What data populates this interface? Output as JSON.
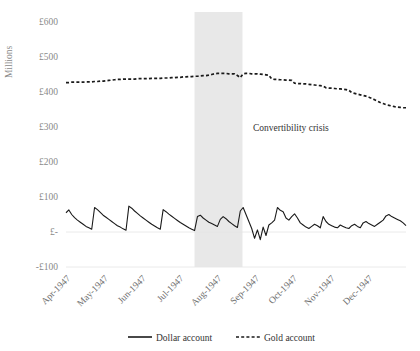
{
  "chart_data": {
    "type": "line",
    "title": "",
    "xlabel": "",
    "ylabel": "Millions",
    "ylim": [
      -100,
      600
    ],
    "ytick_labels": [
      "£600",
      "£500",
      "£400",
      "£300",
      "£200",
      "£100",
      "£-",
      "-£100"
    ],
    "ytick_values": [
      600,
      500,
      400,
      300,
      200,
      100,
      0,
      -100
    ],
    "xtick_labels": [
      "Apr-1947",
      "May-1947",
      "Jun-1947",
      "Jul-1947",
      "Aug-1947",
      "Sep-1947",
      "Oct-1947",
      "Nov-1947",
      "Dec-1947"
    ],
    "grid": "horizontal-faint",
    "legend_position": "bottom",
    "annotations": [
      {
        "text": "Convertibility crisis",
        "x_fraction": 0.55,
        "y_value": 290
      }
    ],
    "shaded_bands": [
      {
        "label": "Convertibility crisis",
        "x_start_fraction": 0.378,
        "x_end_fraction": 0.519,
        "color": "#e8e8e8"
      }
    ],
    "series": [
      {
        "name": "Dollar account",
        "style": "solid",
        "color": "#1a1a1a",
        "values": [
          55,
          63,
          50,
          41,
          34,
          28,
          22,
          16,
          12,
          8,
          70,
          64,
          56,
          48,
          42,
          36,
          30,
          24,
          18,
          14,
          9,
          5,
          74,
          68,
          60,
          53,
          46,
          40,
          34,
          28,
          22,
          17,
          12,
          8,
          64,
          58,
          51,
          45,
          39,
          33,
          27,
          22,
          17,
          12,
          8,
          4,
          44,
          48,
          40,
          34,
          28,
          24,
          20,
          16,
          36,
          44,
          38,
          30,
          24,
          18,
          13,
          60,
          70,
          50,
          30,
          10,
          -18,
          6,
          -22,
          14,
          -10,
          20,
          26,
          34,
          70,
          62,
          58,
          40,
          34,
          44,
          52,
          40,
          26,
          20,
          14,
          10,
          16,
          22,
          18,
          12,
          44,
          30,
          22,
          18,
          14,
          12,
          20,
          16,
          12,
          10,
          18,
          22,
          16,
          12,
          26,
          30,
          24,
          20,
          16,
          22,
          28,
          34,
          46,
          50,
          44,
          40,
          36,
          32,
          26,
          18
        ]
      },
      {
        "name": "Gold account",
        "style": "dashed",
        "color": "#1a1a1a",
        "values": [
          427,
          427,
          428,
          428,
          428,
          428,
          428,
          429,
          429,
          429,
          430,
          430,
          431,
          431,
          432,
          433,
          434,
          435,
          436,
          436,
          437,
          437,
          437,
          437,
          437,
          438,
          438,
          438,
          438,
          438,
          439,
          439,
          439,
          439,
          440,
          440,
          440,
          441,
          441,
          442,
          442,
          443,
          443,
          444,
          444,
          445,
          445,
          446,
          447,
          447,
          448,
          450,
          452,
          453,
          453,
          453,
          453,
          452,
          452,
          452,
          447,
          441,
          452,
          453,
          453,
          452,
          452,
          452,
          451,
          450,
          449,
          448,
          437,
          436,
          436,
          435,
          435,
          434,
          434,
          433,
          425,
          424,
          424,
          423,
          423,
          422,
          421,
          420,
          419,
          418,
          417,
          412,
          411,
          411,
          410,
          409,
          409,
          408,
          407,
          405,
          398,
          396,
          394,
          392,
          390,
          388,
          385,
          382,
          378,
          374,
          370,
          367,
          364,
          362,
          360,
          358,
          357,
          356,
          355,
          355
        ]
      }
    ]
  },
  "legend": {
    "items": [
      {
        "label": "Dollar account",
        "marker": "solid-line"
      },
      {
        "label": "Gold account",
        "marker": "dashed-line"
      }
    ]
  }
}
